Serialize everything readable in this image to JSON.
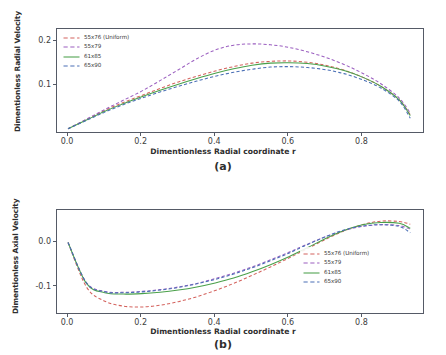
{
  "figure": {
    "panels": [
      {
        "tag": "(a)",
        "xlabel": "Dimentionless Radial coordinate r",
        "ylabel": "Dimentionless Radial Velocity"
      },
      {
        "tag": "(b)",
        "xlabel": "Dimentionless Radial coordinate r",
        "ylabel": "Dimentionless Axial Velocity"
      }
    ]
  },
  "chart_data": [
    {
      "type": "line",
      "title": "",
      "panel": "(a)",
      "xlabel": "Dimentionless Radial coordinate r",
      "ylabel": "Dimentionless Radial Velocity",
      "xlim": [
        -0.03,
        0.97
      ],
      "ylim": [
        -0.012,
        0.228
      ],
      "xticks": [
        0.0,
        0.2,
        0.4,
        0.6,
        0.8
      ],
      "xticklabels": [
        "0.0",
        "0.2",
        "0.4",
        "0.6",
        "0.8"
      ],
      "yticks": [
        0.1,
        0.2
      ],
      "yticklabels": [
        "0.1",
        "0.2"
      ],
      "grid": false,
      "legend_position": "upper left",
      "x": [
        0.0,
        0.05,
        0.1,
        0.15,
        0.2,
        0.25,
        0.3,
        0.35,
        0.4,
        0.45,
        0.5,
        0.55,
        0.6,
        0.65,
        0.7,
        0.75,
        0.8,
        0.85,
        0.9,
        0.93
      ],
      "series": [
        {
          "name": "55x76 (Uniform)",
          "color": "#d4635e",
          "style": "dashed",
          "values": [
            0.0,
            0.021,
            0.042,
            0.06,
            0.076,
            0.092,
            0.107,
            0.12,
            0.132,
            0.142,
            0.15,
            0.154,
            0.155,
            0.152,
            0.145,
            0.134,
            0.118,
            0.097,
            0.066,
            0.032
          ]
        },
        {
          "name": "55x79",
          "color": "#9b5fc0",
          "style": "dashed",
          "values": [
            0.0,
            0.022,
            0.044,
            0.065,
            0.086,
            0.11,
            0.135,
            0.16,
            0.18,
            0.191,
            0.194,
            0.192,
            0.186,
            0.176,
            0.163,
            0.147,
            0.127,
            0.103,
            0.07,
            0.036
          ]
        },
        {
          "name": "61x85",
          "color": "#4aa04a",
          "style": "solid",
          "values": [
            0.0,
            0.02,
            0.04,
            0.057,
            0.073,
            0.088,
            0.102,
            0.115,
            0.127,
            0.137,
            0.145,
            0.15,
            0.151,
            0.149,
            0.143,
            0.133,
            0.118,
            0.097,
            0.066,
            0.03
          ]
        },
        {
          "name": "65x90",
          "color": "#4a6fb5",
          "style": "dashed",
          "values": [
            0.0,
            0.019,
            0.038,
            0.055,
            0.07,
            0.084,
            0.097,
            0.109,
            0.12,
            0.129,
            0.136,
            0.141,
            0.142,
            0.14,
            0.135,
            0.126,
            0.112,
            0.093,
            0.063,
            0.024
          ]
        }
      ]
    },
    {
      "type": "line",
      "title": "",
      "panel": "(b)",
      "xlabel": "Dimentionless Radial coordinate r",
      "ylabel": "Dimentionless Axial Velocity",
      "xlim": [
        -0.03,
        0.97
      ],
      "ylim": [
        -0.163,
        0.073
      ],
      "xticks": [
        0.0,
        0.2,
        0.4,
        0.6,
        0.8
      ],
      "xticklabels": [
        "0.0",
        "0.2",
        "0.4",
        "0.6",
        "0.8"
      ],
      "yticks": [
        0.0,
        -0.1
      ],
      "yticklabels": [
        "0.0",
        "-0.1"
      ],
      "grid": false,
      "legend_position": "lower right",
      "x": [
        0.0,
        0.05,
        0.1,
        0.15,
        0.2,
        0.25,
        0.3,
        0.35,
        0.4,
        0.45,
        0.5,
        0.55,
        0.6,
        0.65,
        0.7,
        0.75,
        0.8,
        0.85,
        0.9,
        0.93
      ],
      "series": [
        {
          "name": "55x76 (Uniform)",
          "color": "#d4635e",
          "style": "dashed",
          "values": [
            0.0,
            -0.1,
            -0.132,
            -0.143,
            -0.145,
            -0.141,
            -0.133,
            -0.122,
            -0.108,
            -0.092,
            -0.074,
            -0.055,
            -0.035,
            -0.014,
            0.007,
            0.026,
            0.04,
            0.048,
            0.047,
            0.041
          ]
        },
        {
          "name": "55x79",
          "color": "#9b5fc0",
          "style": "dashed",
          "values": [
            0.0,
            -0.09,
            -0.11,
            -0.112,
            -0.11,
            -0.106,
            -0.1,
            -0.092,
            -0.081,
            -0.069,
            -0.055,
            -0.039,
            -0.022,
            -0.004,
            0.013,
            0.027,
            0.036,
            0.04,
            0.038,
            0.03
          ]
        },
        {
          "name": "61x85",
          "color": "#4aa04a",
          "style": "solid",
          "values": [
            0.0,
            -0.092,
            -0.113,
            -0.116,
            -0.115,
            -0.112,
            -0.107,
            -0.1,
            -0.091,
            -0.08,
            -0.066,
            -0.05,
            -0.032,
            -0.012,
            0.009,
            0.027,
            0.04,
            0.045,
            0.043,
            0.032
          ]
        },
        {
          "name": "65x90",
          "color": "#4a6fb5",
          "style": "dashed",
          "values": [
            0.0,
            -0.091,
            -0.111,
            -0.113,
            -0.111,
            -0.107,
            -0.101,
            -0.093,
            -0.083,
            -0.071,
            -0.057,
            -0.041,
            -0.024,
            -0.005,
            0.013,
            0.028,
            0.037,
            0.04,
            0.036,
            0.022
          ]
        }
      ]
    }
  ]
}
